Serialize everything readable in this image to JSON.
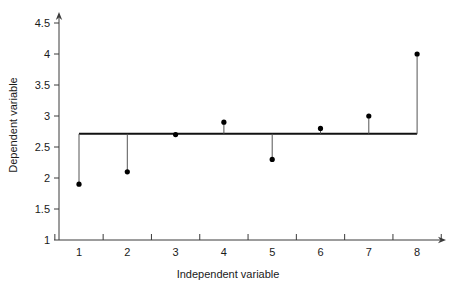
{
  "chart_data": {
    "type": "scatter",
    "title": "",
    "xlabel": "Independent variable",
    "ylabel": "Dependent variable",
    "x": [
      1,
      2,
      3,
      4,
      5,
      6,
      7,
      8
    ],
    "values": [
      1.9,
      2.1,
      2.7,
      2.9,
      2.3,
      2.8,
      3.0,
      4.0
    ],
    "categories": [
      "1",
      "2",
      "3",
      "4",
      "5",
      "6",
      "7",
      "8"
    ],
    "xtick_labels": [
      "1",
      "2",
      "3",
      "4",
      "5",
      "6",
      "7",
      "8"
    ],
    "ytick_labels": [
      "1",
      "1.5",
      "2",
      "2.5",
      "3",
      "3.5",
      "4",
      "4.5"
    ],
    "ytick_values": [
      1,
      1.5,
      2,
      2.5,
      3,
      3.5,
      4,
      4.5
    ],
    "xlim": [
      0.5,
      8.5
    ],
    "ylim": [
      1,
      4.7
    ],
    "grid": false,
    "legend": false,
    "reference_line": {
      "label": "mean",
      "value": 2.7125,
      "style": "solid"
    },
    "residual_stems": true,
    "marker": "filled-circle",
    "colors": {
      "point": "#000000",
      "reference_line": "#111111",
      "stem": "#555555",
      "axis": "#3a3a3a",
      "text": "#1a1a1a",
      "background": "#ffffff"
    }
  }
}
